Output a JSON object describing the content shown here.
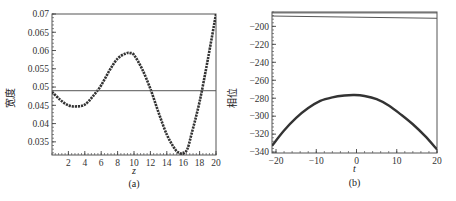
{
  "chart_data": [
    {
      "id": "a",
      "type": "line",
      "panel_label": "(a)",
      "xlabel": "z",
      "ylabel": "宽度",
      "xlim": [
        0,
        20
      ],
      "ylim": [
        0.0314,
        0.07
      ],
      "xticks": [
        2,
        4,
        6,
        8,
        10,
        12,
        14,
        16,
        18,
        20
      ],
      "yticks": [
        0.035,
        0.04,
        0.045,
        0.05,
        0.055,
        0.06,
        0.065,
        0.07
      ],
      "ytick_labels": [
        "0.035",
        "0.04",
        "0.045",
        "0.05",
        "0.055",
        "0.06",
        "0.065",
        "0.07"
      ],
      "grid": false,
      "series": [
        {
          "name": "width",
          "style": "dotted-thick",
          "x": [
            0,
            1,
            2,
            3,
            4,
            5,
            6,
            7,
            8,
            9,
            9.5,
            10,
            11,
            12,
            13,
            14,
            15,
            15.5,
            16,
            16.5,
            17,
            18,
            19,
            20
          ],
          "y": [
            0.0487,
            0.0465,
            0.045,
            0.0447,
            0.0452,
            0.0475,
            0.0505,
            0.0545,
            0.0578,
            0.0592,
            0.0593,
            0.0588,
            0.0549,
            0.0495,
            0.043,
            0.037,
            0.033,
            0.032,
            0.0318,
            0.033,
            0.037,
            0.046,
            0.0575,
            0.07
          ]
        },
        {
          "name": "reference",
          "style": "thin-line",
          "x": [
            0,
            20
          ],
          "y": [
            0.049,
            0.049
          ]
        }
      ]
    },
    {
      "id": "b",
      "type": "line",
      "panel_label": "(b)",
      "xlabel": "t",
      "ylabel": "相位",
      "xlim": [
        -21,
        20
      ],
      "ylim": [
        -341,
        -184
      ],
      "xticks": [
        -20,
        -10,
        0,
        10,
        20
      ],
      "xtick_labels": [
        "−20",
        "−10",
        "0",
        "10",
        "20"
      ],
      "yticks": [
        -200,
        -220,
        -240,
        -260,
        -280,
        -300,
        -320,
        -340
      ],
      "ytick_labels": [
        "−200",
        "−220",
        "−240",
        "−260",
        "−280",
        "−300",
        "−320",
        "−340"
      ],
      "grid": false,
      "series": [
        {
          "name": "phase",
          "style": "thick-line",
          "x": [
            -21,
            -18,
            -15,
            -12,
            -9,
            -6,
            -3,
            -0.5,
            2,
            5,
            8,
            11,
            14,
            17,
            20
          ],
          "y": [
            -333,
            -316,
            -302,
            -291,
            -283,
            -279,
            -277,
            -276.5,
            -277.5,
            -281,
            -288,
            -298,
            -309,
            -322,
            -337
          ]
        },
        {
          "name": "reference-1",
          "style": "thin-line",
          "x": [
            -21,
            20
          ],
          "y": [
            -185,
            -185
          ]
        },
        {
          "name": "reference-2",
          "style": "thin-line",
          "x": [
            -21,
            20
          ],
          "y": [
            -188.5,
            -191
          ]
        }
      ]
    }
  ]
}
